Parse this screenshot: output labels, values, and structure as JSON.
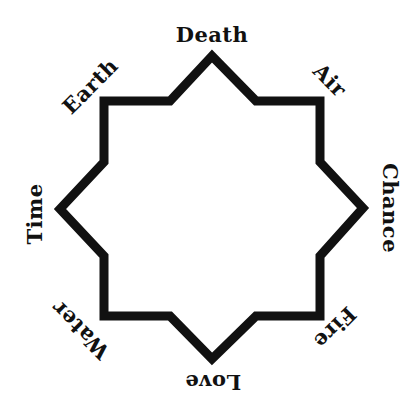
{
  "diagram": {
    "shape": "eight-pointed star",
    "stroke_color": "#111111",
    "background": "#ffffff",
    "labels": [
      {
        "id": "top",
        "text": "Death",
        "x": 212,
        "y": 34,
        "rotate": 0
      },
      {
        "id": "top-right",
        "text": "Air",
        "x": 330,
        "y": 80,
        "rotate": 45
      },
      {
        "id": "right",
        "text": "Chance",
        "x": 390,
        "y": 208,
        "rotate": 90
      },
      {
        "id": "bottom-right",
        "text": "Fire",
        "x": 335,
        "y": 328,
        "rotate": 135
      },
      {
        "id": "bottom",
        "text": "Love",
        "x": 213,
        "y": 382,
        "rotate": 180
      },
      {
        "id": "bottom-left",
        "text": "Water",
        "x": 80,
        "y": 330,
        "rotate": 225
      },
      {
        "id": "left",
        "text": "Time",
        "x": 34,
        "y": 214,
        "rotate": 270
      },
      {
        "id": "top-left",
        "text": "Earth",
        "x": 90,
        "y": 86,
        "rotate": 315
      }
    ]
  }
}
